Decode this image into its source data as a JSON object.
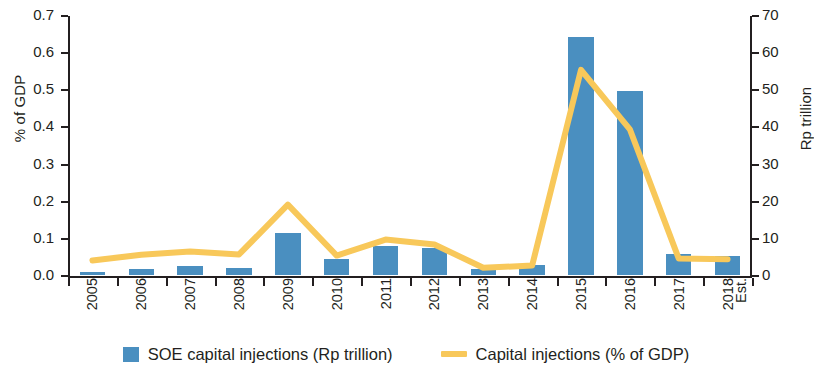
{
  "chart_data": {
    "type": "bar",
    "title": "",
    "categories": [
      "2005",
      "2006",
      "2007",
      "2008",
      "2009",
      "2010",
      "2011",
      "2012",
      "2013",
      "2014",
      "2015",
      "2016",
      "2017",
      "2018"
    ],
    "category_sublabels": [
      "",
      "",
      "",
      "",
      "",
      "",
      "",
      "",
      "",
      "",
      "",
      "",
      "",
      "Est."
    ],
    "xlabel": "",
    "ylabel": "% of GDP",
    "y2label": "Rp trillion",
    "ylim": [
      0.0,
      0.7
    ],
    "y2lim": [
      0,
      70
    ],
    "yticks": [
      "0.0",
      "0.1",
      "0.2",
      "0.3",
      "0.4",
      "0.5",
      "0.6",
      "0.7"
    ],
    "y2ticks": [
      "0",
      "10",
      "20",
      "30",
      "40",
      "50",
      "60",
      "70"
    ],
    "grid": false,
    "legend_position": "bottom",
    "series": [
      {
        "name": "SOE capital injections (Rp trillion)",
        "type": "bar",
        "axis": "right",
        "color": "#4a8fc0",
        "values": [
          0.7,
          1.7,
          2.5,
          2.0,
          11.2,
          4.2,
          7.7,
          7.2,
          1.5,
          2.7,
          64.0,
          49.5,
          5.7,
          5.2
        ]
      },
      {
        "name": "Capital injections (% of GDP)",
        "type": "line",
        "axis": "left",
        "color": "#f8c85a",
        "values": [
          0.042,
          0.057,
          0.066,
          0.058,
          0.192,
          0.055,
          0.098,
          0.085,
          0.022,
          0.028,
          0.555,
          0.395,
          0.047,
          0.045
        ]
      }
    ]
  },
  "legend": {
    "items": [
      {
        "label": "SOE capital injections (Rp trillion)",
        "marker": "square",
        "color": "#4a8fc0"
      },
      {
        "label": "Capital injections (% of GDP)",
        "marker": "line",
        "color": "#f8c85a"
      }
    ]
  },
  "axes": {
    "left_title": "% of GDP",
    "right_title": "Rp trillion"
  }
}
